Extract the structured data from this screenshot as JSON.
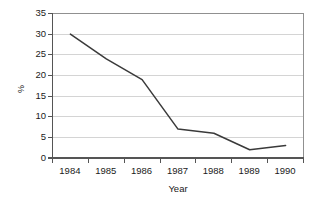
{
  "chart_data": {
    "type": "line",
    "title": "",
    "subtitle": "",
    "xlabel": "Year",
    "ylabel": "%",
    "x": [
      1984,
      1985,
      1986,
      1987,
      1988,
      1989,
      1990
    ],
    "categories": [
      "1984",
      "1985",
      "1986",
      "1987",
      "1988",
      "1989",
      "1990"
    ],
    "series": [
      {
        "name": "",
        "values": [
          30,
          24,
          19,
          7,
          6,
          2,
          3
        ]
      }
    ],
    "values": [
      30,
      24,
      19,
      7,
      6,
      2,
      3
    ],
    "xlim": [
      1983.5,
      1990.5
    ],
    "ylim": [
      0,
      35
    ],
    "ytick_labels": [
      "0",
      "5",
      "10",
      "15",
      "20",
      "25",
      "30",
      "35"
    ],
    "ytick_values": [
      0,
      5,
      10,
      15,
      20,
      25,
      30,
      35
    ],
    "xtick_labels": [
      "1984",
      "1985",
      "1986",
      "1987",
      "1988",
      "1989",
      "1990"
    ],
    "grid": "horizontal",
    "legend": "none",
    "line_color": "#3a3a3a",
    "grid_color": "#d4d4d4",
    "axis_color": "#808080",
    "background_color": "#ffffff",
    "markers": "none",
    "annotations": []
  }
}
